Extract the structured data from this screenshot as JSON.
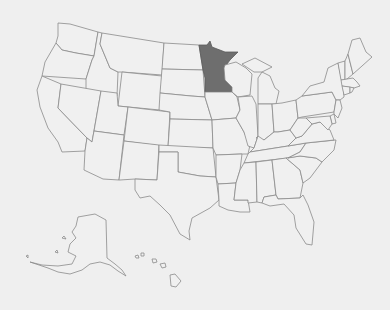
{
  "map": {
    "title": "United States",
    "background_color": "#efefef",
    "state_fill": "#f0f0f0",
    "border_color": "#8a8a8a",
    "highlight_color": "#6e6e6e",
    "highlighted_states": [
      "Minnesota"
    ],
    "states": [
      {
        "id": "WA",
        "name": "Washington"
      },
      {
        "id": "OR",
        "name": "Oregon"
      },
      {
        "id": "CA",
        "name": "California"
      },
      {
        "id": "ID",
        "name": "Idaho"
      },
      {
        "id": "NV",
        "name": "Nevada"
      },
      {
        "id": "MT",
        "name": "Montana"
      },
      {
        "id": "WY",
        "name": "Wyoming"
      },
      {
        "id": "UT",
        "name": "Utah"
      },
      {
        "id": "AZ",
        "name": "Arizona"
      },
      {
        "id": "CO",
        "name": "Colorado"
      },
      {
        "id": "NM",
        "name": "New Mexico"
      },
      {
        "id": "ND",
        "name": "North Dakota"
      },
      {
        "id": "SD",
        "name": "South Dakota"
      },
      {
        "id": "NE",
        "name": "Nebraska"
      },
      {
        "id": "KS",
        "name": "Kansas"
      },
      {
        "id": "OK",
        "name": "Oklahoma"
      },
      {
        "id": "TX",
        "name": "Texas"
      },
      {
        "id": "MN",
        "name": "Minnesota"
      },
      {
        "id": "IA",
        "name": "Iowa"
      },
      {
        "id": "MO",
        "name": "Missouri"
      },
      {
        "id": "AR",
        "name": "Arkansas"
      },
      {
        "id": "LA",
        "name": "Louisiana"
      },
      {
        "id": "WI",
        "name": "Wisconsin"
      },
      {
        "id": "IL",
        "name": "Illinois"
      },
      {
        "id": "MI",
        "name": "Michigan"
      },
      {
        "id": "IN",
        "name": "Indiana"
      },
      {
        "id": "OH",
        "name": "Ohio"
      },
      {
        "id": "KY",
        "name": "Kentucky"
      },
      {
        "id": "TN",
        "name": "Tennessee"
      },
      {
        "id": "MS",
        "name": "Mississippi"
      },
      {
        "id": "AL",
        "name": "Alabama"
      },
      {
        "id": "GA",
        "name": "Georgia"
      },
      {
        "id": "FL",
        "name": "Florida"
      },
      {
        "id": "SC",
        "name": "South Carolina"
      },
      {
        "id": "NC",
        "name": "North Carolina"
      },
      {
        "id": "VA",
        "name": "Virginia"
      },
      {
        "id": "WV",
        "name": "West Virginia"
      },
      {
        "id": "PA",
        "name": "Pennsylvania"
      },
      {
        "id": "NY",
        "name": "New York"
      },
      {
        "id": "VT",
        "name": "Vermont"
      },
      {
        "id": "NH",
        "name": "New Hampshire"
      },
      {
        "id": "ME",
        "name": "Maine"
      },
      {
        "id": "MA",
        "name": "Massachusetts"
      },
      {
        "id": "CT",
        "name": "Connecticut"
      },
      {
        "id": "RI",
        "name": "Rhode Island"
      },
      {
        "id": "NJ",
        "name": "New Jersey"
      },
      {
        "id": "DE",
        "name": "Delaware"
      },
      {
        "id": "MD",
        "name": "Maryland"
      },
      {
        "id": "AK",
        "name": "Alaska"
      },
      {
        "id": "HI",
        "name": "Hawaii"
      }
    ]
  }
}
